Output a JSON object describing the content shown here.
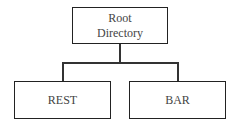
{
  "diagram": {
    "type": "tree",
    "root": {
      "label_line1": "Root",
      "label_line2": "Directory"
    },
    "children": [
      {
        "label": "REST"
      },
      {
        "label": "BAR"
      }
    ],
    "colors": {
      "stroke": "#222222",
      "text": "#444444",
      "background": "#ffffff"
    }
  }
}
